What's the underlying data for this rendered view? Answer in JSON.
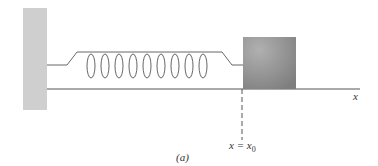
{
  "figure": {
    "axis_label": "x",
    "position_label": "x = x",
    "position_subscript": "0",
    "caption": "(a)",
    "colors": {
      "wall": "#cfcfcf",
      "block": "#8f8f8f",
      "line": "#555555"
    }
  }
}
